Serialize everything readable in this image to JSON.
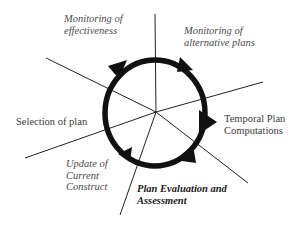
{
  "diagram": {
    "type": "cyclic process diagram",
    "center": {
      "x": 156,
      "y": 112
    },
    "cycle_direction": "clockwise",
    "colors": {
      "ring": "#111111",
      "spokes": "#222222",
      "text": "#3a3a3a",
      "emphasis_text": "#1a1a1a",
      "background": "#ffffff"
    },
    "labels": [
      {
        "id": "monitoring-effectiveness",
        "lines": [
          "Monitoring of",
          "effectiveness"
        ],
        "style": "italic"
      },
      {
        "id": "monitoring-alternative-plans",
        "lines": [
          "Monitoring of",
          "alternative plans"
        ],
        "style": "italic"
      },
      {
        "id": "temporal-plan-computations",
        "lines": [
          "Temporal Plan",
          "Computations"
        ],
        "style": "regular"
      },
      {
        "id": "plan-evaluation",
        "lines": [
          "Plan Evaluation and",
          "Assessment"
        ],
        "style": "bold-italic"
      },
      {
        "id": "update-current-construct",
        "lines": [
          "Update of",
          "Current",
          "Construct"
        ],
        "style": "italic"
      },
      {
        "id": "selection-of-plan",
        "lines": [
          "Selection of plan"
        ],
        "style": "regular"
      }
    ]
  }
}
